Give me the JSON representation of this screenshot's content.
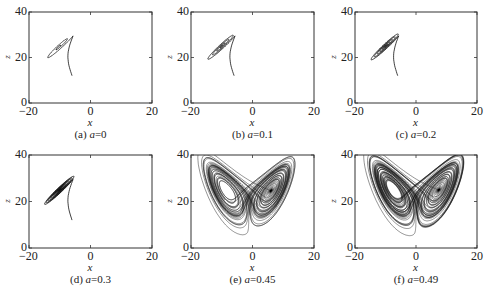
{
  "chart_data": [
    {
      "type": "line",
      "panel": "a",
      "caption_prefix": "(a) ",
      "param_symbol": "a",
      "param_value": "=0",
      "xlabel": "x",
      "ylabel": "z",
      "xlim": [
        -20,
        20
      ],
      "ylim": [
        0,
        40
      ],
      "xticks": [
        "−20",
        "0",
        "20"
      ],
      "yticks": [
        "0",
        "20",
        "40"
      ],
      "grid": false,
      "description": "Trajectory spirals inward to a stable fixed point near (-10, 25)",
      "series": [
        {
          "name": "trajectory",
          "start": [
            -6,
            12
          ],
          "attractor": [
            -10,
            25
          ],
          "kind": "stable-spiral",
          "turns": 2
        }
      ]
    },
    {
      "type": "line",
      "panel": "b",
      "caption_prefix": "(b) ",
      "param_symbol": "a",
      "param_value": "=0.1",
      "xlabel": "x",
      "ylabel": "z",
      "xlim": [
        -20,
        20
      ],
      "ylim": [
        0,
        40
      ],
      "xticks": [
        "−20",
        "0",
        "20"
      ],
      "yticks": [
        "0",
        "20",
        "40"
      ],
      "grid": false,
      "description": "Trajectory spirals inward to stable fixed point near (-10, 25) with more turns",
      "series": [
        {
          "name": "trajectory",
          "start": [
            -6,
            12
          ],
          "attractor": [
            -10,
            25
          ],
          "kind": "stable-spiral",
          "turns": 4
        }
      ]
    },
    {
      "type": "line",
      "panel": "c",
      "caption_prefix": "(c) ",
      "param_symbol": "a",
      "param_value": "=0.2",
      "xlabel": "x",
      "ylabel": "z",
      "xlim": [
        -20,
        20
      ],
      "ylim": [
        0,
        40
      ],
      "xticks": [
        "−20",
        "0",
        "20"
      ],
      "yticks": [
        "0",
        "20",
        "40"
      ],
      "grid": false,
      "description": "Trajectory spirals inward to stable fixed point near (-10, 25)",
      "series": [
        {
          "name": "trajectory",
          "start": [
            -6,
            12
          ],
          "attractor": [
            -10,
            25
          ],
          "kind": "stable-spiral",
          "turns": 6
        }
      ]
    },
    {
      "type": "line",
      "panel": "d",
      "caption_prefix": "(d) ",
      "param_symbol": "a",
      "param_value": "=0.3",
      "xlabel": "x",
      "ylabel": "z",
      "xlim": [
        -20,
        20
      ],
      "ylim": [
        0,
        40
      ],
      "xticks": [
        "−20",
        "0",
        "20"
      ],
      "yticks": [
        "0",
        "20",
        "40"
      ],
      "grid": false,
      "description": "Many-turn spiral converging to fixed point near (-10, 25)",
      "series": [
        {
          "name": "trajectory",
          "start": [
            -6,
            12
          ],
          "attractor": [
            -10,
            25
          ],
          "kind": "stable-spiral",
          "turns": 11
        }
      ]
    },
    {
      "type": "line",
      "panel": "e",
      "caption_prefix": "(e) ",
      "param_symbol": "a",
      "param_value": "=0.45",
      "xlabel": "x",
      "ylabel": "z",
      "xlim": [
        -20,
        20
      ],
      "ylim": [
        0,
        40
      ],
      "xticks": [
        "−20",
        "0",
        "20"
      ],
      "yticks": [
        "0",
        "20",
        "40"
      ],
      "grid": false,
      "description": "Chaotic two-lobe butterfly attractor; lobes centered near (-10, 25) and (10, 25), z from ~8 to ~36",
      "series": [
        {
          "name": "trajectory",
          "kind": "chaotic-attractor",
          "lobe_centers": [
            [
              -10,
              25
            ],
            [
              10,
              25
            ]
          ],
          "x_range": [
            -19,
            16
          ],
          "z_range": [
            8,
            36
          ]
        }
      ]
    },
    {
      "type": "line",
      "panel": "f",
      "caption_prefix": "(f) ",
      "param_symbol": "a",
      "param_value": "=0.49",
      "xlabel": "x",
      "ylabel": "z",
      "xlim": [
        -20,
        20
      ],
      "ylim": [
        0,
        40
      ],
      "xticks": [
        "−20",
        "0",
        "20"
      ],
      "yticks": [
        "0",
        "20",
        "40"
      ],
      "grid": false,
      "description": "Fully developed chaotic butterfly attractor, symmetric lobes near (-11, 24) and (11, 24), z from ~8 to ~37",
      "series": [
        {
          "name": "trajectory",
          "kind": "chaotic-attractor",
          "lobe_centers": [
            [
              -11,
              24
            ],
            [
              11,
              24
            ]
          ],
          "x_range": [
            -18,
            18
          ],
          "z_range": [
            8,
            37
          ]
        }
      ]
    }
  ]
}
